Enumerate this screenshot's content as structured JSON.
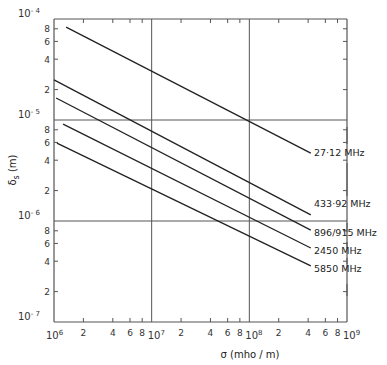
{
  "chart_data": {
    "type": "line",
    "title": "",
    "xlabel": "σ (mho / m)",
    "ylabel": "δs (m)",
    "xscale": "log",
    "yscale": "log",
    "xlim": [
      1000000.0,
      1000000000.0
    ],
    "ylim": [
      1e-07,
      0.0001
    ],
    "grid": "major decades only",
    "x_decade_labels": [
      "10^6",
      "10^7",
      "10^8",
      "10^9"
    ],
    "x_minor_tick_labels": [
      "2",
      "4",
      "6",
      "8"
    ],
    "y_decade_labels": [
      "10^-4",
      "10^-5",
      "10^-6",
      "10^-7"
    ],
    "y_minor_tick_labels": [
      "8",
      "6",
      "4",
      "2"
    ],
    "legend_position": "right, inline labels at line ends",
    "series": [
      {
        "name": "27·12 MHz",
        "x": [
          1330000.0,
          426000000.0
        ],
        "y": [
          8.3e-05,
          4.7e-06
        ]
      },
      {
        "name": "433·92 MHz",
        "x": [
          1000000.0,
          426000000.0
        ],
        "y": [
          2.5e-05,
          1.15e-06
        ]
      },
      {
        "name": "896/915 MHz",
        "x": [
          1050000.0,
          426000000.0
        ],
        "y": [
          1.65e-05,
          8.1e-07
        ]
      },
      {
        "name": "2450 MHz",
        "x": [
          1240000.0,
          426000000.0
        ],
        "y": [
          9.1e-06,
          5.4e-07
        ]
      },
      {
        "name": "5850 MHz",
        "x": [
          1070000.0,
          426000000.0
        ],
        "y": [
          5.9e-06,
          3.6e-07
        ]
      }
    ]
  },
  "labels": {
    "x_axis": "σ  (mho / m)",
    "y_axis_main": "δ",
    "y_axis_sub": "s",
    "y_axis_unit": "(m)",
    "series": [
      "27·12 MHz",
      "433·92 MHz",
      "896/915 MHz",
      "2450 MHz",
      "5850 MHz"
    ],
    "x_decades": [
      {
        "base": "10",
        "exp": "6"
      },
      {
        "base": "10",
        "exp": "7"
      },
      {
        "base": "10",
        "exp": "8"
      },
      {
        "base": "10",
        "exp": "9"
      }
    ],
    "y_decades": [
      {
        "base": "10",
        "exp": "- 4"
      },
      {
        "base": "10",
        "exp": "- 5"
      },
      {
        "base": "10",
        "exp": "- 6"
      },
      {
        "base": "10",
        "exp": "- 7"
      }
    ],
    "x_minor": [
      "2",
      "4",
      "6",
      "8"
    ],
    "y_minor": [
      "8",
      "6",
      "4",
      "2"
    ]
  }
}
